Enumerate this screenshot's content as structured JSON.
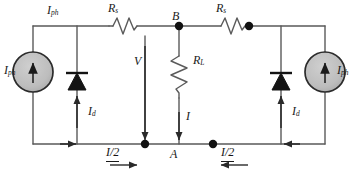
{
  "figure": {
    "type": "circuit-schematic",
    "background": "#ffffff",
    "wire_color": "#5a5a5a",
    "ink_color": "#1a1a1a",
    "source_fill": "#b9b9b9"
  },
  "labels": {
    "iph_left": {
      "symbol": "I",
      "sub": "ph"
    },
    "iph_left_top": {
      "symbol": "I",
      "sub": "ph"
    },
    "iph_right": {
      "symbol": "I",
      "sub": "ph"
    },
    "rs_left": {
      "symbol": "R",
      "sub": "s"
    },
    "rs_right": {
      "symbol": "R",
      "sub": "s"
    },
    "rl": {
      "symbol": "R",
      "sub": "L"
    },
    "id_left": {
      "symbol": "I",
      "sub": "d"
    },
    "id_right": {
      "symbol": "I",
      "sub": "d"
    },
    "voltage": {
      "symbol": "V",
      "sub": ""
    },
    "current": {
      "symbol": "I",
      "sub": ""
    },
    "node_b": {
      "symbol": "B",
      "sub": ""
    },
    "node_a": {
      "symbol": "A",
      "sub": ""
    },
    "half_current_left": "I/2",
    "half_current_right": "I/2"
  },
  "components": {
    "current_source_left": "current-source",
    "current_source_right": "current-source",
    "diode_left": "diode",
    "diode_right": "diode",
    "resistor_series_left": "resistor",
    "resistor_series_right": "resistor",
    "resistor_load": "resistor"
  },
  "nodes": {
    "junction_top_center": "B",
    "junction_bottom_center": "A"
  }
}
